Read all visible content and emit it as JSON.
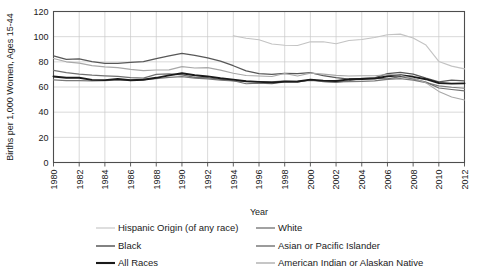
{
  "chart_data": {
    "type": "line",
    "title": "",
    "xlabel": "Year",
    "ylabel": "Births per 1,000 Women, Ages 15-44",
    "xlim": [
      1980,
      2012
    ],
    "ylim": [
      0,
      120
    ],
    "ytick_step": 20,
    "xtick_step": 2,
    "grid": true,
    "legend_position": "bottom",
    "yticks": [
      "0",
      "20",
      "40",
      "60",
      "80",
      "100",
      "120"
    ],
    "xticks": [
      "1980",
      "1982",
      "1984",
      "1986",
      "1988",
      "1990",
      "1992",
      "1994",
      "1996",
      "1998",
      "2000",
      "2002",
      "2004",
      "2006",
      "2008",
      "2010",
      "2012"
    ],
    "x": [
      1980,
      1981,
      1982,
      1983,
      1984,
      1985,
      1986,
      1987,
      1988,
      1989,
      1990,
      1991,
      1992,
      1993,
      1994,
      1995,
      1996,
      1997,
      1998,
      1999,
      2000,
      2001,
      2002,
      2003,
      2004,
      2005,
      2006,
      2007,
      2008,
      2009,
      2010,
      2011,
      2012
    ],
    "series": [
      {
        "name": "Hispanic Origin (of any race)",
        "color": "#c3c3c3",
        "width": 1.1,
        "start_year": 1994,
        "values": [
          null,
          null,
          null,
          null,
          null,
          null,
          null,
          null,
          null,
          null,
          null,
          null,
          null,
          null,
          100.7,
          98.8,
          97.5,
          94.2,
          93.2,
          93.0,
          95.9,
          96.0,
          94.4,
          96.9,
          97.8,
          99.4,
          101.5,
          102.0,
          99.0,
          93.3,
          80.3,
          76.6,
          74.4
        ]
      },
      {
        "name": "White",
        "color": "#7a7a7a",
        "width": 1.2,
        "start_year": 1980,
        "values": [
          65.6,
          65.1,
          65.1,
          64.8,
          65.0,
          65.6,
          65.4,
          65.8,
          66.6,
          67.6,
          68.3,
          67.1,
          66.5,
          65.4,
          64.9,
          64.4,
          64.3,
          64.0,
          64.8,
          64.4,
          65.3,
          64.4,
          64.0,
          64.2,
          64.4,
          64.8,
          66.0,
          66.7,
          65.5,
          63.5,
          60.9,
          59.8,
          59.0
        ]
      },
      {
        "name": "Black",
        "color": "#585858",
        "width": 1.3,
        "start_year": 1980,
        "values": [
          84.7,
          82.0,
          82.4,
          80.1,
          78.8,
          78.8,
          79.6,
          80.1,
          82.6,
          84.8,
          86.8,
          85.2,
          83.2,
          80.5,
          76.9,
          72.8,
          70.7,
          70.0,
          70.9,
          70.6,
          71.4,
          69.1,
          67.4,
          66.3,
          66.7,
          67.2,
          70.6,
          71.6,
          70.3,
          67.0,
          64.0,
          65.4,
          64.9
        ]
      },
      {
        "name": "Asian or Pacific Islander",
        "color": "#707070",
        "width": 1.2,
        "start_year": 1980,
        "values": [
          73.2,
          71.4,
          70.2,
          69.4,
          68.9,
          68.4,
          67.4,
          67.1,
          70.0,
          70.4,
          69.6,
          67.6,
          67.2,
          66.0,
          65.0,
          62.6,
          63.0,
          62.6,
          64.0,
          63.8,
          65.8,
          64.3,
          63.7,
          65.1,
          66.8,
          66.8,
          66.5,
          68.2,
          66.5,
          63.9,
          59.2,
          58.0,
          57.0
        ]
      },
      {
        "name": "All Races",
        "color": "#1a1a1a",
        "width": 1.9,
        "start_year": 1980,
        "values": [
          68.4,
          67.4,
          67.3,
          65.7,
          65.5,
          66.3,
          65.4,
          65.8,
          67.3,
          69.2,
          70.9,
          69.3,
          68.4,
          67.0,
          65.9,
          64.6,
          64.1,
          63.6,
          64.3,
          64.4,
          65.9,
          65.1,
          64.8,
          66.1,
          66.3,
          66.7,
          68.5,
          69.3,
          68.1,
          66.2,
          63.2,
          62.7,
          62.9
        ]
      },
      {
        "name": "American Indian or Alaskan Native",
        "color": "#a8a8a8",
        "width": 1.1,
        "start_year": 1980,
        "values": [
          82.7,
          80.0,
          79.0,
          77.0,
          76.0,
          75.4,
          74.0,
          73.0,
          73.5,
          73.6,
          76.2,
          75.1,
          75.4,
          73.4,
          70.9,
          69.1,
          68.7,
          68.3,
          70.7,
          68.8,
          71.0,
          70.2,
          69.2,
          68.7,
          69.0,
          68.9,
          69.9,
          69.3,
          67.0,
          63.3,
          56.5,
          52.1,
          49.6
        ]
      }
    ]
  },
  "legend": {
    "entries": [
      {
        "label": "Hispanic Origin (of any race)",
        "color": "#c3c3c3",
        "width": 1.1
      },
      {
        "label": "White",
        "color": "#7a7a7a",
        "width": 1.4
      },
      {
        "label": "Black",
        "color": "#585858",
        "width": 1.5
      },
      {
        "label": "Asian or Pacific Islander",
        "color": "#707070",
        "width": 1.4
      },
      {
        "label": "All Races",
        "color": "#1a1a1a",
        "width": 2.1
      },
      {
        "label": "American Indian or Alaskan Native",
        "color": "#a8a8a8",
        "width": 1.3
      }
    ]
  }
}
